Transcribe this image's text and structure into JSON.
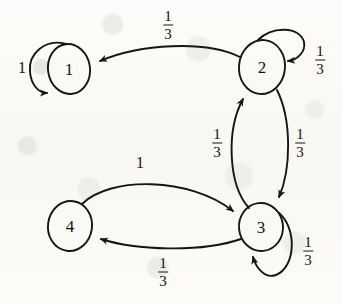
{
  "figure": {
    "kind": "state-transition-diagram",
    "background_color": "#fbfaf7",
    "ink_color": "#181510"
  },
  "nodes": [
    {
      "id": "1",
      "label": "1",
      "cx": 69,
      "cy": 69,
      "rx": 21,
      "ry": 25
    },
    {
      "id": "2",
      "label": "2",
      "cx": 262,
      "cy": 67,
      "rx": 23,
      "ry": 27
    },
    {
      "id": "3",
      "label": "3",
      "cx": 261,
      "cy": 227,
      "rx": 22,
      "ry": 24
    },
    {
      "id": "4",
      "label": "4",
      "cx": 70,
      "cy": 226,
      "rx": 22,
      "ry": 25
    }
  ],
  "edges": [
    {
      "from": "1",
      "to": "1",
      "kind": "self-loop",
      "label": "1",
      "label_x": 22,
      "label_y": 68
    },
    {
      "from": "2",
      "to": "1",
      "kind": "curve",
      "label": "1/3",
      "label_x": 168,
      "label_y": 25
    },
    {
      "from": "2",
      "to": "2",
      "kind": "self-loop",
      "label": "1/3",
      "label_x": 320,
      "label_y": 60
    },
    {
      "from": "3",
      "to": "2",
      "kind": "curve",
      "label": "1/3",
      "label_x": 217,
      "label_y": 143
    },
    {
      "from": "2",
      "to": "3",
      "kind": "curve",
      "label": "1/3",
      "label_x": 300,
      "label_y": 143
    },
    {
      "from": "3",
      "to": "3",
      "kind": "self-loop",
      "label": "1/3",
      "label_x": 308,
      "label_y": 251
    },
    {
      "from": "4",
      "to": "3",
      "kind": "curve",
      "label": "1",
      "label_x": 140,
      "label_y": 163
    },
    {
      "from": "3",
      "to": "4",
      "kind": "curve",
      "label": "1/3",
      "label_x": 163,
      "label_y": 272
    }
  ],
  "labels": {
    "one": "1",
    "three": "3",
    "numerator": "1",
    "denominator": "3"
  }
}
